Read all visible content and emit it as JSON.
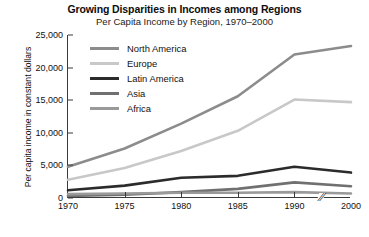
{
  "chart_data": {
    "type": "line",
    "title": "Growing Disparities in Incomes among Regions",
    "subtitle": "Per Capita Income by Region, 1970–2000",
    "xlabel": "",
    "ylabel": "Per capita income in constant dollars",
    "x": [
      1970,
      1975,
      1980,
      1985,
      1990,
      2000
    ],
    "xtick_labels": [
      "1970",
      "1975",
      "1980",
      "1985",
      "1990",
      "2000"
    ],
    "ytick_labels": [
      "0",
      "5,000",
      "10,000",
      "15,000",
      "20,000",
      "25,000"
    ],
    "ytick_values": [
      0,
      5000,
      10000,
      15000,
      20000,
      25000
    ],
    "xlim": [
      1970,
      2000
    ],
    "ylim": [
      0,
      25000
    ],
    "grid": false,
    "axis_break": true,
    "axis_break_label": "//",
    "legend_position": "upper-left-inside",
    "series": [
      {
        "name": "North America",
        "color": "#8c8c8c",
        "width": 2.6,
        "values": [
          4800,
          7600,
          11400,
          15600,
          22000,
          23300
        ]
      },
      {
        "name": "Europe",
        "color": "#c8c8c8",
        "width": 2.6,
        "values": [
          2800,
          4600,
          7200,
          10300,
          15100,
          14700
        ]
      },
      {
        "name": "Latin America",
        "color": "#2b2b2b",
        "width": 2.6,
        "values": [
          1200,
          1900,
          3100,
          3400,
          4800,
          3900
        ]
      },
      {
        "name": "Asia",
        "color": "#707070",
        "width": 2.6,
        "values": [
          300,
          500,
          900,
          1400,
          2400,
          1800
        ]
      },
      {
        "name": "Africa",
        "color": "#9a9a9a",
        "width": 2.6,
        "values": [
          600,
          700,
          800,
          800,
          900,
          700
        ]
      }
    ]
  }
}
